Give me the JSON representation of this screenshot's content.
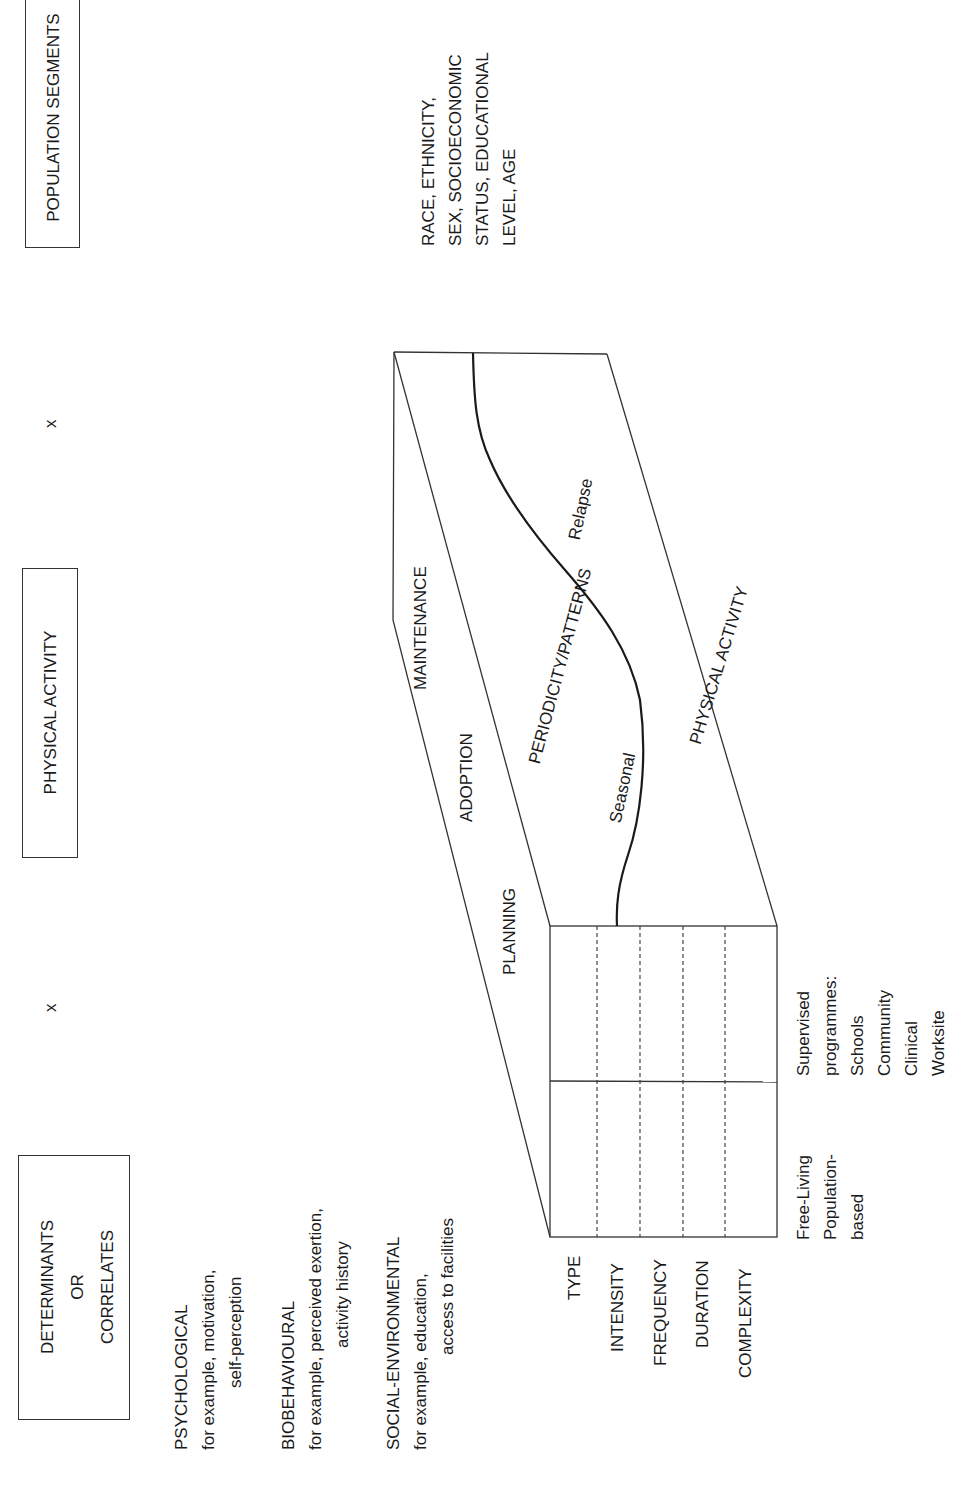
{
  "diagram": {
    "orientation": "rotated -90deg (landscape page shown in portrait)",
    "headers": {
      "determinants": [
        "DETERMINANTS",
        "OR",
        "CORRELATES"
      ],
      "physical_activity": "PHYSICAL ACTIVITY",
      "population_segments": "POPULATION SEGMENTS"
    },
    "operators": {
      "x1": "x",
      "x2": "x"
    },
    "determinants": [
      {
        "title": "PSYCHOLOGICAL",
        "line1": "for example, motivation,",
        "line2": "self-perception"
      },
      {
        "title": "BIOBEHAVIOURAL",
        "line1": "for example, perceived exertion,",
        "line2": "activity history"
      },
      {
        "title": "SOCIAL-ENVIRONMENTAL",
        "line1": "for example, education,",
        "line2": "access to facilities"
      }
    ],
    "population_segments_text": [
      "RACE, ETHNICITY,",
      "SEX, SOCIOECONOMIC",
      "STATUS, EDUCATIONAL",
      "LEVEL, AGE"
    ],
    "box_top_face": {
      "stages": [
        "PLANNING",
        "ADOPTION",
        "MAINTENANCE"
      ]
    },
    "box_middle_face": {
      "label": "PERIODICITY/PATTERNS",
      "curve_labels": [
        "Seasonal",
        "Relapse"
      ]
    },
    "box_right_face": {
      "label": "PHYSICAL ACTIVITY"
    },
    "box_front_face": {
      "rows": [
        "TYPE",
        "INTENSITY",
        "FREQUENCY",
        "DURATION",
        "COMPLEXITY"
      ],
      "columns": [
        {
          "lines": [
            "Free-Living",
            "Population-",
            "based"
          ]
        },
        {
          "lines": [
            "Supervised",
            "programmes:",
            "Schools",
            "Community",
            "Clinical",
            "Worksite"
          ]
        }
      ]
    }
  }
}
